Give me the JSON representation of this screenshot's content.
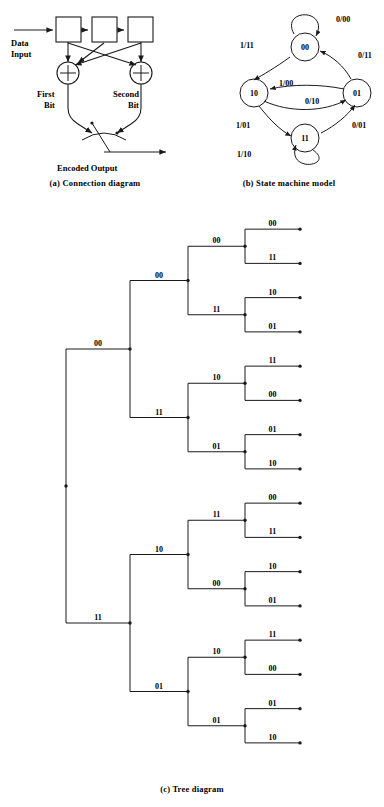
{
  "figure": {
    "title_sections": [
      "(a) Connection diagram",
      "(b) State machine model",
      "(c) Tree diagram"
    ]
  },
  "connection_diagram": {
    "caption": "(a) Connection diagram",
    "input_label_line1": "Data",
    "input_label_line2": "Input",
    "adder_symbol": "+",
    "first_bit_line1": "First",
    "first_bit_line2": "Bit",
    "second_bit_line1": "Second",
    "second_bit_line2": "Bit",
    "output_label": "Encoded Output",
    "registers": [
      "",
      "",
      ""
    ]
  },
  "state_machine": {
    "caption": "(b) State machine model",
    "states": [
      {
        "name": "00",
        "cx": 305,
        "cy": 47
      },
      {
        "name": "10",
        "cx": 254,
        "cy": 93
      },
      {
        "name": "01",
        "cx": 357,
        "cy": 93
      },
      {
        "name": "11",
        "cx": 305,
        "cy": 138
      }
    ],
    "transitions": [
      {
        "label": "0/00",
        "from": "00",
        "to": "00",
        "x": 336,
        "y": 22
      },
      {
        "label": "1/11",
        "from": "00",
        "to": "10",
        "x": 249,
        "y": 48
      },
      {
        "label": "0/11",
        "from": "01",
        "to": "00",
        "x": 361,
        "y": 55
      },
      {
        "label": "1/00",
        "from": "01",
        "to": "10",
        "x": 297,
        "y": 84
      },
      {
        "label": "0/10",
        "from": "10",
        "to": "01",
        "x": 317,
        "y": 100
      },
      {
        "label": "1/01",
        "from": "10",
        "to": "11",
        "x": 245,
        "y": 127
      },
      {
        "label": "0/01",
        "from": "11",
        "to": "01",
        "x": 359,
        "y": 127
      },
      {
        "label": "1/10",
        "from": "11",
        "to": "11",
        "x": 246,
        "y": 155
      }
    ]
  },
  "tree_diagram": {
    "caption": "(c) Tree diagram",
    "root": {
      "x": 66,
      "y": 512
    },
    "level1": [
      {
        "label": "00",
        "y": 310
      },
      {
        "label": "11",
        "y": 714
      }
    ],
    "level2": [
      {
        "label": "00",
        "y": 260
      },
      {
        "label": "11",
        "y": 387
      },
      {
        "label": "10",
        "y": 614
      },
      {
        "label": "01",
        "y": 747
      }
    ],
    "level3": [
      {
        "label": "00",
        "y": 233
      },
      {
        "label": "11",
        "y": 296
      },
      {
        "label": "10",
        "y": 358
      },
      {
        "label": "01",
        "y": 422
      },
      {
        "label": "11",
        "y": 583
      },
      {
        "label": "00",
        "y": 648
      },
      {
        "label": "10",
        "y": 682
      },
      {
        "label": "01",
        "y": 747
      }
    ],
    "level3_labels_ordered": [
      "00",
      "11",
      "10",
      "01",
      "11",
      "00",
      "10",
      "01",
      "11",
      "00",
      "10",
      "01",
      "11",
      "00",
      "10",
      "01"
    ],
    "level4_labels_ordered": [
      "00",
      "11",
      "10",
      "01",
      "11",
      "00",
      "01",
      "10",
      "00",
      "11",
      "10",
      "01",
      "11",
      "00",
      "01",
      "10",
      "00",
      "11",
      "10",
      "01",
      "11",
      "00",
      "01",
      "10",
      "00",
      "11",
      "10",
      "01",
      "11",
      "00",
      "01",
      "10"
    ],
    "leaf_pair_pattern": [
      [
        "00",
        "11"
      ],
      [
        "10",
        "01"
      ],
      [
        "11",
        "00"
      ],
      [
        "01",
        "10"
      ]
    ],
    "branch_count_leaves": 32
  }
}
